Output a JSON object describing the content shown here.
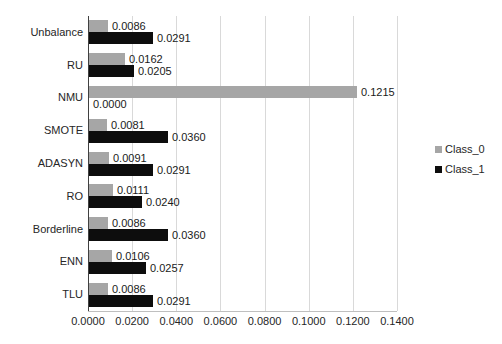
{
  "chart_data": {
    "type": "bar",
    "orientation": "horizontal",
    "title": "",
    "xlabel": "",
    "ylabel": "",
    "categories": [
      "Unbalance",
      "RU",
      "NMU",
      "SMOTE",
      "ADASYN",
      "RO",
      "Borderline",
      "ENN",
      "TLU"
    ],
    "series": [
      {
        "name": "Class_0",
        "color": "#a6a6a6",
        "values": [
          0.0086,
          0.0162,
          0.1215,
          0.0081,
          0.0091,
          0.0111,
          0.0086,
          0.0106,
          0.0086
        ]
      },
      {
        "name": "Class_1",
        "color": "#0d0d0d",
        "values": [
          0.0291,
          0.0205,
          0.0,
          0.036,
          0.0291,
          0.024,
          0.036,
          0.0257,
          0.0291
        ]
      }
    ],
    "data_labels": {
      "Class_0": [
        "0.0086",
        "0.0162",
        "0.1215",
        "0.0081",
        "0.0091",
        "0.0111",
        "0.0086",
        "0.0106",
        "0.0086"
      ],
      "Class_1": [
        "0.0291",
        "0.0205",
        "0.0000",
        "0.0360",
        "0.0291",
        "0.0240",
        "0.0360",
        "0.0257",
        "0.0291"
      ]
    },
    "xlim": [
      0,
      0.14
    ],
    "xticks": [
      "0.0000",
      "0.0200",
      "0.0400",
      "0.0600",
      "0.0800",
      "0.1000",
      "0.1200",
      "0.1400"
    ],
    "grid": true,
    "legend_position": "right",
    "legend": [
      {
        "label": "Class_0",
        "color": "#a6a6a6"
      },
      {
        "label": "Class_1",
        "color": "#0d0d0d"
      }
    ]
  }
}
